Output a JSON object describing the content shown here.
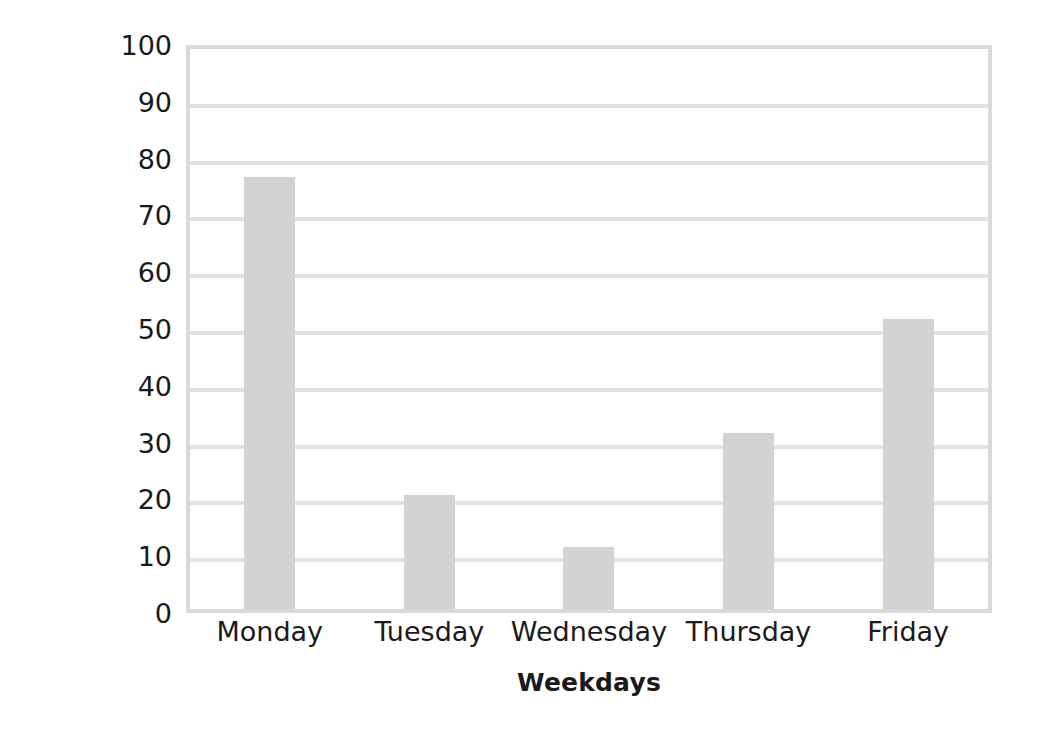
{
  "chart_data": {
    "type": "bar",
    "title": "",
    "subtitle": "",
    "xlabel": "Weekdays",
    "ylabel": "Chance of Snow in Percentage",
    "categories": [
      "Monday",
      "Tuesday",
      "Wednesday",
      "Thursday",
      "Friday"
    ],
    "values": [
      76,
      20,
      11,
      31,
      51
    ],
    "ylim": [
      0,
      100
    ],
    "ytick_labels": [
      "100",
      "90",
      "80",
      "70",
      "60",
      "50",
      "40",
      "30",
      "20",
      "10",
      "0"
    ],
    "ytick_values": [
      100,
      90,
      80,
      70,
      60,
      50,
      40,
      30,
      20,
      10,
      0
    ],
    "ytick_step": 10,
    "grid": true,
    "grid_axis": "y",
    "legend": false,
    "legend_position": "none",
    "bar_color": "#d3d3d3",
    "grid_color": "#e2e2e2",
    "axis_color": "#d9d9d9",
    "text_color": "#1a1a1a",
    "background_color": "#ffffff",
    "annotations": []
  }
}
